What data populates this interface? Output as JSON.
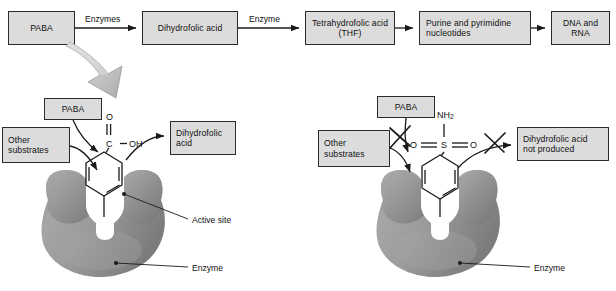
{
  "figure": {
    "width": 616,
    "height": 291,
    "background_color": "#ffffff",
    "box_fill_color": "#dcdcdc",
    "box_border_color": "#2b2b2b",
    "enzyme_color": "#9a9a9a",
    "enzyme_shadow_color": "#6f6f6f",
    "big_arrow_color": "#cfcfcf"
  },
  "pathway": {
    "steps": [
      {
        "id": "paba",
        "label": "PABA"
      },
      {
        "id": "dihydrofolic-acid",
        "label": "Dihydrofolic acid"
      },
      {
        "id": "thf",
        "label": "Tetrahydrofolic acid (THF)"
      },
      {
        "id": "nucleotides",
        "label": "Purine and pyrimidine nucleotides"
      },
      {
        "id": "dna-rna",
        "label": "DNA and RNA"
      }
    ],
    "arrow_labels": [
      {
        "id": "enzymes",
        "label": "Enzymes"
      },
      {
        "id": "enzyme",
        "label": "Enzyme"
      }
    ]
  },
  "normal_panel": {
    "paba_box": "PABA",
    "other_substrates_box": "Other\nsubstrates",
    "other_substrates_line1": "Other",
    "other_substrates_line2": "substrates",
    "product_box": "Dihydrofolic\nacid",
    "product_line1": "Dihydrofolic",
    "product_line2": "acid",
    "active_site_label": "Active site",
    "enzyme_label": "Enzyme",
    "molecule": {
      "name": "PABA",
      "atoms": {
        "carbonyl_oxygen": "O",
        "carboxyl_carbon": "C",
        "hydroxyl": "OH",
        "amine": "NH",
        "amine_subscript": "2"
      }
    }
  },
  "inhibited_panel": {
    "paba_box": "PABA",
    "other_substrates_box": "Other\nsubstrates",
    "other_substrates_line1": "Other",
    "other_substrates_line2": "substrates",
    "product_box": "Dihydrofolic acid\nnot produced",
    "product_line1": "Dihydrofolic acid",
    "product_line2": "not produced",
    "enzyme_label": "Enzyme",
    "blocked_marks": [
      {
        "id": "paba-blocked",
        "symbol": "X"
      },
      {
        "id": "product-blocked",
        "symbol": "X"
      }
    ],
    "molecule": {
      "name": "Sulfanilamide",
      "atoms": {
        "top_amine": "NH",
        "top_amine_subscript": "2",
        "left_oxygen": "O",
        "sulfur": "S",
        "right_oxygen": "O",
        "bottom_amine": "NH",
        "bottom_amine_subscript": "2"
      }
    }
  }
}
